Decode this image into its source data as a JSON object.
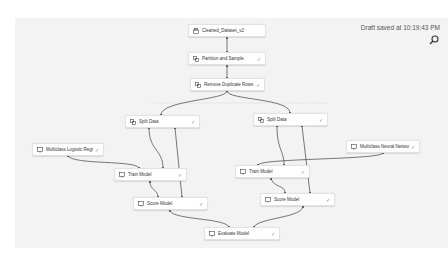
{
  "header": {
    "status": "Draft saved at 10:19:43 PM",
    "search_icon": "search-icon"
  },
  "nodes": [
    {
      "id": "cleaned",
      "label": "Cleaned_Dataset_v2",
      "icon": "dataset-icon",
      "check": ""
    },
    {
      "id": "partition",
      "label": "Partition and Sample",
      "icon": "module-icon",
      "check": "✓"
    },
    {
      "id": "dedupe",
      "label": "Remove Duplicate Rows",
      "icon": "module-icon",
      "check": "✓"
    },
    {
      "id": "split1",
      "label": "Split Data",
      "icon": "module-icon",
      "check": "✓"
    },
    {
      "id": "split2",
      "label": "Split Data",
      "icon": "module-icon",
      "check": "✓"
    },
    {
      "id": "mlr",
      "label": "Multiclass Logistic Regression",
      "icon": "model-icon",
      "check": "✓"
    },
    {
      "id": "mnn",
      "label": "Multiclass Neural Network",
      "icon": "model-icon",
      "check": "✓"
    },
    {
      "id": "train1",
      "label": "Train Model",
      "icon": "model-icon",
      "check": "✓"
    },
    {
      "id": "train2",
      "label": "Train Model",
      "icon": "model-icon",
      "check": "✓"
    },
    {
      "id": "score1",
      "label": "Score Model",
      "icon": "model-icon",
      "check": "✓"
    },
    {
      "id": "score2",
      "label": "Score Model",
      "icon": "model-icon",
      "check": "✓"
    },
    {
      "id": "evaluate",
      "label": "Evaluate Model",
      "icon": "model-icon",
      "check": "✓"
    }
  ],
  "colors": {
    "canvas": "#f3f3f3",
    "wire": "#555555",
    "node_border": "#e2e2e2"
  }
}
